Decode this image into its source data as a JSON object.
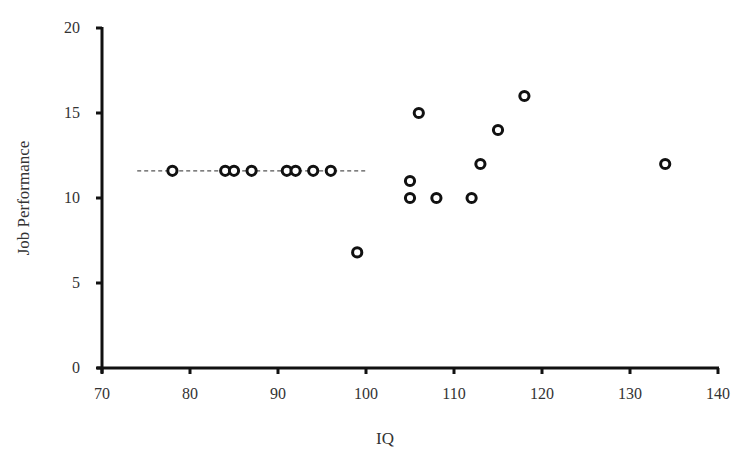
{
  "chart_data": {
    "type": "scatter",
    "title": "",
    "xlabel": "IQ",
    "ylabel": "Job Performance",
    "xlim": [
      70,
      140
    ],
    "ylim": [
      0,
      20
    ],
    "x_ticks": [
      70,
      80,
      90,
      100,
      110,
      120,
      130,
      140
    ],
    "y_ticks": [
      0,
      5,
      10,
      15,
      20
    ],
    "grid": false,
    "legend": null,
    "series": [
      {
        "name": "observations",
        "marker": "open-circle",
        "points": [
          {
            "x": 78,
            "y": 11.6
          },
          {
            "x": 84,
            "y": 11.6
          },
          {
            "x": 85,
            "y": 11.6
          },
          {
            "x": 87,
            "y": 11.6
          },
          {
            "x": 91,
            "y": 11.6
          },
          {
            "x": 92,
            "y": 11.6
          },
          {
            "x": 94,
            "y": 11.6
          },
          {
            "x": 96,
            "y": 11.6
          },
          {
            "x": 99,
            "y": 6.8
          },
          {
            "x": 105,
            "y": 11
          },
          {
            "x": 105,
            "y": 10
          },
          {
            "x": 106,
            "y": 15
          },
          {
            "x": 108,
            "y": 10
          },
          {
            "x": 112,
            "y": 10
          },
          {
            "x": 113,
            "y": 12
          },
          {
            "x": 115,
            "y": 14
          },
          {
            "x": 118,
            "y": 16
          },
          {
            "x": 134,
            "y": 12
          }
        ]
      }
    ],
    "annotations": [
      {
        "type": "dashed-line",
        "x_start": 74,
        "x_end": 100,
        "y": 11.6
      }
    ]
  },
  "axes": {
    "x_title": "IQ",
    "y_title": "Job Performance"
  }
}
